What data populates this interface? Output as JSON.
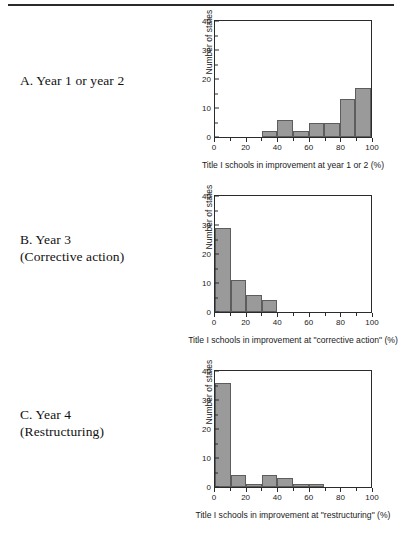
{
  "figure": {
    "panels": [
      {
        "id": "a",
        "caption_line1": "A. Year 1 or year 2",
        "caption_line2": ""
      },
      {
        "id": "b",
        "caption_line1": "B. Year 3",
        "caption_line2": "(Corrective action)"
      },
      {
        "id": "c",
        "caption_line1": "C. Year 4",
        "caption_line2": "(Restructuring)"
      }
    ]
  },
  "chart_data": [
    {
      "type": "bar",
      "panel": "A",
      "title": "",
      "xlabel": "Title I schools in improvement at year 1 or 2 (%)",
      "ylabel": "Number of states",
      "xlim": [
        0,
        100
      ],
      "ylim": [
        0,
        40
      ],
      "xticks": [
        0,
        20,
        40,
        60,
        80,
        100
      ],
      "xtick_labels": [
        "0",
        "20",
        "40",
        "60",
        "80",
        "100"
      ],
      "xminor_ticks": [
        10,
        30,
        50,
        70,
        90
      ],
      "yticks": [
        0,
        10,
        20,
        30,
        40
      ],
      "ytick_labels": [
        "0",
        "10",
        "20",
        "30",
        "40"
      ],
      "yminor_ticks": [
        5,
        15,
        25,
        35
      ],
      "grid": false,
      "legend": false,
      "bin_width": 10,
      "bin_starts": [
        0,
        10,
        20,
        30,
        40,
        50,
        60,
        70,
        80,
        90
      ],
      "categories": [
        "0-10",
        "10-20",
        "20-30",
        "30-40",
        "40-50",
        "50-60",
        "60-70",
        "70-80",
        "80-90",
        "90-100"
      ],
      "values": [
        0,
        0,
        0,
        2,
        6,
        2,
        5,
        5,
        13,
        17
      ],
      "bar_color": "#9a9a9a",
      "bar_edge_color": "#5d5d5d"
    },
    {
      "type": "bar",
      "panel": "B",
      "title": "",
      "xlabel": "Title I schools in improvement at \"corrective action\" (%)",
      "ylabel": "Number of states",
      "xlim": [
        0,
        100
      ],
      "ylim": [
        0,
        40
      ],
      "xticks": [
        0,
        20,
        40,
        60,
        80,
        100
      ],
      "xtick_labels": [
        "0",
        "20",
        "40",
        "60",
        "80",
        "100"
      ],
      "xminor_ticks": [
        10,
        30,
        50,
        70,
        90
      ],
      "yticks": [
        0,
        10,
        20,
        30,
        40
      ],
      "ytick_labels": [
        "0",
        "10",
        "20",
        "30",
        "40"
      ],
      "yminor_ticks": [
        5,
        15,
        25,
        35
      ],
      "grid": false,
      "legend": false,
      "bin_width": 10,
      "bin_starts": [
        0,
        10,
        20,
        30,
        40,
        50,
        60,
        70,
        80,
        90
      ],
      "categories": [
        "0-10",
        "10-20",
        "20-30",
        "30-40",
        "40-50",
        "50-60",
        "60-70",
        "70-80",
        "80-90",
        "90-100"
      ],
      "values": [
        29,
        11,
        6,
        4,
        0,
        0,
        0,
        0,
        0,
        0
      ],
      "bar_color": "#9a9a9a",
      "bar_edge_color": "#5d5d5d"
    },
    {
      "type": "bar",
      "panel": "C",
      "title": "",
      "xlabel": "Title I schools in improvement at \"restructuring\" (%)",
      "ylabel": "Number of states",
      "xlim": [
        0,
        100
      ],
      "ylim": [
        0,
        40
      ],
      "xticks": [
        0,
        20,
        40,
        60,
        80,
        100
      ],
      "xtick_labels": [
        "0",
        "20",
        "40",
        "60",
        "80",
        "100"
      ],
      "xminor_ticks": [
        10,
        30,
        50,
        70,
        90
      ],
      "yticks": [
        0,
        10,
        20,
        30,
        40
      ],
      "ytick_labels": [
        "0",
        "10",
        "20",
        "30",
        "40"
      ],
      "yminor_ticks": [
        5,
        15,
        25,
        35
      ],
      "grid": false,
      "legend": false,
      "bin_width": 10,
      "bin_starts": [
        0,
        10,
        20,
        30,
        40,
        50,
        60,
        70,
        80,
        90
      ],
      "categories": [
        "0-10",
        "10-20",
        "20-30",
        "30-40",
        "40-50",
        "50-60",
        "60-70",
        "70-80",
        "80-90",
        "90-100"
      ],
      "values": [
        36,
        4,
        1,
        4,
        3,
        1,
        1,
        0,
        0,
        0
      ],
      "bar_color": "#9a9a9a",
      "bar_edge_color": "#5d5d5d"
    }
  ]
}
